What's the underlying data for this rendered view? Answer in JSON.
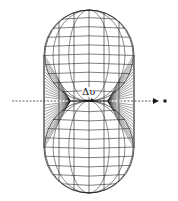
{
  "figure": {
    "label": "Δυ",
    "stroke_color": "#1a1a1a",
    "background": "#ffffff",
    "axis": {
      "y": 101,
      "x_start": 12,
      "x_end": 158,
      "dot_x": 165
    },
    "shape": {
      "center_x": 89,
      "top_y": 10,
      "bottom_y": 193,
      "left_x": 44,
      "right_x": 134,
      "waist_left_x": 70,
      "waist_right_x": 108,
      "meridians": 7,
      "latitudes_per_half": 9,
      "fan_lines": 14
    }
  }
}
